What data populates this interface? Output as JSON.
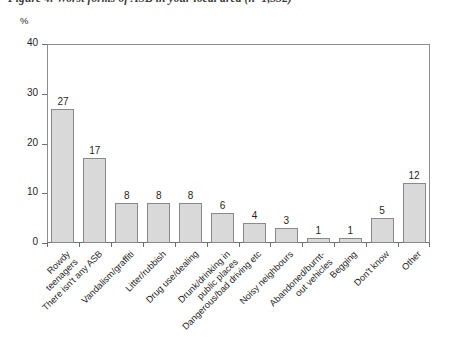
{
  "figure": {
    "caption": "Figure 4: Worst forms of ASB in your local area (n=1,332)"
  },
  "axis": {
    "y_unit": "%",
    "y_ticks": [
      "0",
      "10",
      "20",
      "30",
      "40"
    ]
  },
  "chart_data": {
    "type": "bar",
    "title": "Figure 4: Worst forms of ASB in your local area (n=1,332)",
    "xlabel": "",
    "ylabel": "%",
    "ylim": [
      0,
      40
    ],
    "ytick_values": [
      0,
      10,
      20,
      30,
      40
    ],
    "grid": false,
    "legend": "none",
    "bar_color": "#d9d9d9",
    "bar_border_color": "#8a8a8a",
    "categories": [
      "Rowdy\nteenagers",
      "There isn't any ASB",
      "Vandalism/graffiti",
      "Litter/rubbish",
      "Drug use/dealing",
      "Drunk/drinking in\npublic places",
      "Dangerous/bad driving etc",
      "Noisy neighbours",
      "Abandoned/burnt-\nout vehicles",
      "Begging",
      "Don't know",
      "Other"
    ],
    "values": [
      27,
      17,
      8,
      8,
      8,
      6,
      4,
      3,
      1,
      1,
      5,
      12
    ],
    "data_labels": [
      "27",
      "17",
      "8",
      "8",
      "8",
      "6",
      "4",
      "3",
      "1",
      "1",
      "5",
      "12"
    ]
  },
  "bars": [
    {
      "label_lines": [
        "Rowdy",
        "teenagers"
      ],
      "value": 27,
      "value_label": "27"
    },
    {
      "label_lines": [
        "There isn't any ASB"
      ],
      "value": 17,
      "value_label": "17"
    },
    {
      "label_lines": [
        "Vandalism/graffiti"
      ],
      "value": 8,
      "value_label": "8"
    },
    {
      "label_lines": [
        "Litter/rubbish"
      ],
      "value": 8,
      "value_label": "8"
    },
    {
      "label_lines": [
        "Drug use/dealing"
      ],
      "value": 8,
      "value_label": "8"
    },
    {
      "label_lines": [
        "Drunk/drinking in",
        "public places"
      ],
      "value": 6,
      "value_label": "6"
    },
    {
      "label_lines": [
        "Dangerous/bad driving etc"
      ],
      "value": 4,
      "value_label": "4"
    },
    {
      "label_lines": [
        "Noisy neighbours"
      ],
      "value": 3,
      "value_label": "3"
    },
    {
      "label_lines": [
        "Abandoned/burnt-",
        "out vehicles"
      ],
      "value": 1,
      "value_label": "1"
    },
    {
      "label_lines": [
        "Begging"
      ],
      "value": 1,
      "value_label": "1"
    },
    {
      "label_lines": [
        "Don't know"
      ],
      "value": 5,
      "value_label": "5"
    },
    {
      "label_lines": [
        "Other"
      ],
      "value": 12,
      "value_label": "12"
    }
  ]
}
